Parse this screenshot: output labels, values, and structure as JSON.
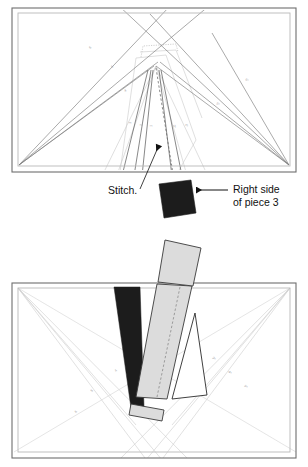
{
  "figure": {
    "colors": {
      "frame_outer": "#6e6e6e",
      "frame_inner": "#b9b9b9",
      "guide_line": "#cfcfcf",
      "stitch_line": "#6b6b6b",
      "dark_fabric": "#1c1c1c",
      "light_fabric": "#dcdcdc",
      "light_fabric_stroke": "#3a3a3a",
      "white_fabric": "#ffffff",
      "dashed_line": "#8a8a8a",
      "text": "#111111",
      "faint_number": "#9a9a9a",
      "background": "#ffffff"
    },
    "panels": [
      {
        "id": "top-panel",
        "name": "top-diagram",
        "description": "Paper foundation with radiating seam lines, stitch line marked, and dark piece 3 folded below the edge.",
        "annotations": [
          {
            "id": "stitch-annotation",
            "text": "Stitch.",
            "leader": "arrow pointing up-left into the foundation"
          },
          {
            "id": "right-side-annotation",
            "text_line_1": "Right side",
            "text_line_2": "of piece 3",
            "leader": "arrow pointing left at the dark fabric piece"
          }
        ],
        "section_numbers": [
          "6",
          "5",
          "4",
          "3",
          "2",
          "1",
          "3*",
          "4*",
          "5*",
          "6*"
        ]
      },
      {
        "id": "bottom-panel",
        "name": "bottom-diagram",
        "description": "Foundation shown with pieces laid out: black wedge, light gray strip with dashed seam allowance, white triangle, and a small light gray strip below.",
        "pieces": [
          {
            "id": "piece-quad-top",
            "fill": "light",
            "label": ""
          },
          {
            "id": "piece-black-wedge",
            "fill": "dark",
            "label": ""
          },
          {
            "id": "piece-light-strip",
            "fill": "light",
            "label": ""
          },
          {
            "id": "piece-white-triangle",
            "fill": "white",
            "label": ""
          },
          {
            "id": "piece-small-strip",
            "fill": "light",
            "label": ""
          }
        ]
      }
    ]
  }
}
